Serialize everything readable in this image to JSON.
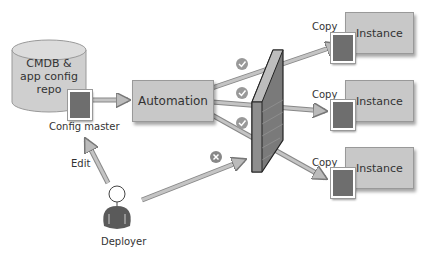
{
  "diagram": {
    "repo": {
      "label_line1": "CMDB &",
      "label_line2": "app config",
      "label_line3": "repo"
    },
    "config_master_label": "Config master",
    "automation_label": "Automation",
    "edit_label": "Edit",
    "deployer_label": "Deployer",
    "instances": [
      {
        "label": "Instance",
        "copy_label": "Copy"
      },
      {
        "label": "Instance",
        "copy_label": "Copy"
      },
      {
        "label": "Instance",
        "copy_label": "Copy"
      }
    ],
    "allowed_paths": 3,
    "blocked_paths": 1,
    "colors": {
      "box": "#c8c8c8",
      "doc": "#6e6e6e",
      "wall": "#7a7a7a",
      "arrow": "#a8a8a8"
    }
  }
}
